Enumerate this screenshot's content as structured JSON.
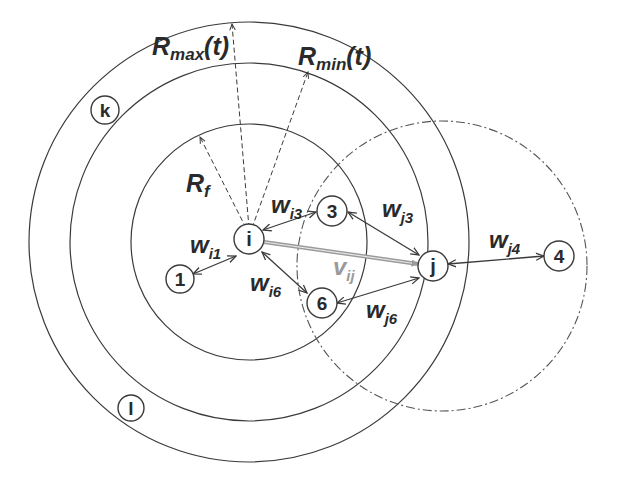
{
  "diagram": {
    "title": "",
    "radii_labels": {
      "rmax": {
        "main": "R",
        "sub": "max",
        "suffix": "(t)"
      },
      "rmin": {
        "main": "R",
        "sub": "min",
        "suffix": "(t)"
      },
      "rf": {
        "main": "R",
        "sub": "f"
      }
    },
    "nodes": [
      {
        "id": "i",
        "label": "i"
      },
      {
        "id": "j",
        "label": "j"
      },
      {
        "id": "k",
        "label": "k"
      },
      {
        "id": "l",
        "label": "l"
      },
      {
        "id": "1",
        "label": "1"
      },
      {
        "id": "3",
        "label": "3"
      },
      {
        "id": "4",
        "label": "4"
      },
      {
        "id": "6",
        "label": "6"
      }
    ],
    "edges": [
      {
        "from": "i",
        "to": "1",
        "label": {
          "main": "w",
          "sub": "i1"
        }
      },
      {
        "from": "i",
        "to": "3",
        "label": {
          "main": "w",
          "sub": "i3"
        }
      },
      {
        "from": "i",
        "to": "6",
        "label": {
          "main": "w",
          "sub": "i6"
        }
      },
      {
        "from": "j",
        "to": "3",
        "label": {
          "main": "w",
          "sub": "j3"
        }
      },
      {
        "from": "j",
        "to": "4",
        "label": {
          "main": "w",
          "sub": "j4"
        }
      },
      {
        "from": "j",
        "to": "6",
        "label": {
          "main": "w",
          "sub": "j6"
        }
      },
      {
        "from": "i",
        "to": "j",
        "label": {
          "main": "v",
          "sub": "ij"
        },
        "style": "double-gray"
      }
    ],
    "colors": {
      "line": "#3a3a3a",
      "vij": "#9a9a9a",
      "background": "#ffffff"
    }
  }
}
